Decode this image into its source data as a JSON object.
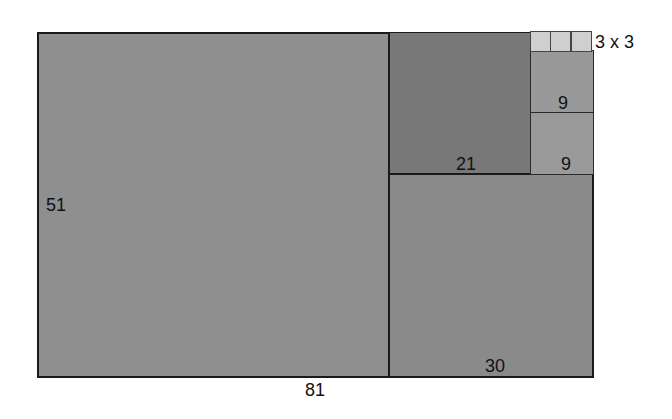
{
  "diagram": {
    "type": "rectangle-decomposition",
    "regions": [
      {
        "id": "large",
        "side_label": "51",
        "bottom_label": "81",
        "color": "#8f8f8f"
      },
      {
        "id": "upper-middle",
        "label": "21",
        "color": "#787878"
      },
      {
        "id": "lower-right",
        "label": "30",
        "color": "#8a8a8a"
      },
      {
        "id": "nine-top",
        "label": "9",
        "color": "#999999"
      },
      {
        "id": "nine-bottom",
        "label": "9",
        "color": "#9a9a9a"
      },
      {
        "id": "small-squares",
        "label": "3 x 3",
        "count": 3,
        "color": "#cfcfcf"
      }
    ]
  },
  "labels": {
    "large_height": "51",
    "large_width": "81",
    "upper_middle": "21",
    "lower_right": "30",
    "nine_top": "9",
    "nine_bottom": "9",
    "small_squares": "3 x 3"
  }
}
